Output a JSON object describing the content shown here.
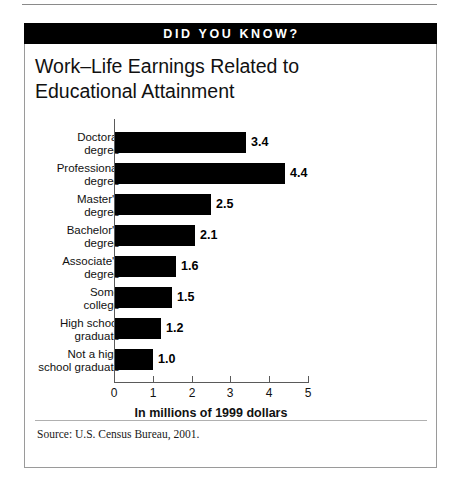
{
  "banner": {
    "label": "DID YOU KNOW?"
  },
  "title": {
    "line1": "Work–Life Earnings Related to",
    "line2": "Educational Attainment"
  },
  "source": {
    "text": "Source: U.S. Census Bureau, 2001."
  },
  "chart_data": {
    "type": "bar",
    "orientation": "horizontal",
    "title": "Work–Life Earnings Related to Educational Attainment",
    "xlabel": "In millions of 1999 dollars",
    "ylabel": "",
    "xlim": [
      0,
      5
    ],
    "xticks": [
      "0",
      "1",
      "2",
      "3",
      "4",
      "5"
    ],
    "grid": false,
    "legend": false,
    "bar_color": "#000000",
    "categories": [
      "Doctoral degree",
      "Professional degree",
      "Master's degree",
      "Bachelor's degree",
      "Associate's degree",
      "Some college",
      "High school graduate",
      "Not a high school graduate"
    ],
    "category_lines": [
      [
        "Doctoral",
        "degree"
      ],
      [
        "Professional",
        "degree"
      ],
      [
        "Master's",
        "degree"
      ],
      [
        "Bachelor's",
        "degree"
      ],
      [
        "Associate's",
        "degree"
      ],
      [
        "Some",
        "college"
      ],
      [
        "High school",
        "graduate"
      ],
      [
        "Not a high",
        "school graduate"
      ]
    ],
    "values": [
      3.4,
      4.4,
      2.5,
      2.1,
      1.6,
      1.5,
      1.2,
      1.0
    ],
    "value_labels": [
      "3.4",
      "4.4",
      "2.5",
      "2.1",
      "1.6",
      "1.5",
      "1.2",
      "1.0"
    ]
  }
}
